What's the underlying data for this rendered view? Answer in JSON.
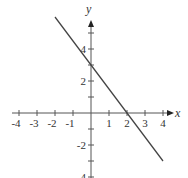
{
  "chart_data": {
    "type": "line",
    "title": "",
    "xlabel": "x",
    "ylabel": "y",
    "xlim": [
      -4,
      4
    ],
    "ylim": [
      -4,
      6
    ],
    "grid": false,
    "x_ticks": [
      -4,
      -3,
      -2,
      -1,
      1,
      2,
      3,
      4
    ],
    "x_tick_labels": [
      "-4",
      "-3",
      "-2",
      "-1",
      "1",
      "2",
      "3",
      "4"
    ],
    "y_ticks": [
      -4,
      -2,
      2,
      4
    ],
    "y_tick_labels": [
      "-4",
      "-2",
      "2",
      "4"
    ],
    "series": [
      {
        "name": "y = -3/2 x + 3",
        "x": [
          -2,
          4
        ],
        "y": [
          6,
          -3
        ],
        "color": "#444444"
      }
    ],
    "intercepts": {
      "x_intercept": 2,
      "y_intercept": 3
    }
  },
  "colors": {
    "axis": "#555555",
    "line": "#444444",
    "text": "#333333"
  }
}
